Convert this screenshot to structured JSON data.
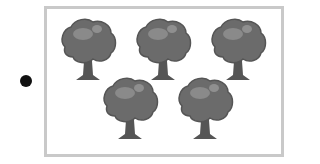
{
  "bullet": {
    "color": "#111111"
  },
  "frame": {
    "border_color": "#c9c9c9"
  },
  "trees": {
    "count": 5,
    "canopy_color": "#6b6b6b",
    "trunk_color": "#555555",
    "items": [
      {
        "row": 1,
        "col": 1
      },
      {
        "row": 1,
        "col": 2
      },
      {
        "row": 1,
        "col": 3
      },
      {
        "row": 2,
        "col": 1
      },
      {
        "row": 2,
        "col": 2
      }
    ]
  }
}
